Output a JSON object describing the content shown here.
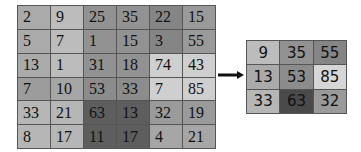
{
  "input_matrix": {
    "rows": [
      [
        "2",
        "9",
        "25",
        "35",
        "22",
        "15"
      ],
      [
        "5",
        "7",
        "1",
        "15",
        "3",
        "55"
      ],
      [
        "13",
        "1",
        "31",
        "18",
        "74",
        "43"
      ],
      [
        "7",
        "10",
        "53",
        "33",
        "7",
        "85"
      ],
      [
        "33",
        "21",
        "63",
        "13",
        "32",
        "19"
      ],
      [
        "8",
        "17",
        "11",
        "17",
        "4",
        "21"
      ]
    ],
    "colors": [
      [
        "#aaaaaa",
        "#bcbcbc",
        "#929292",
        "#929292",
        "#858585",
        "#9a9a9a"
      ],
      [
        "#aaaaaa",
        "#bcbcbc",
        "#929292",
        "#929292",
        "#858585",
        "#9a9a9a"
      ],
      [
        "#aaaaaa",
        "#bcbcbc",
        "#929292",
        "#929292",
        "#cfcfcf",
        "#cfcfcf"
      ],
      [
        "#9c9c9c",
        "#a6a6a6",
        "#8c8c8c",
        "#8c8c8c",
        "#cfcfcf",
        "#cfcfcf"
      ],
      [
        "#b6b6b6",
        "#b6b6b6",
        "#5e5e5e",
        "#5e5e5e",
        "#9a9a9a",
        "#9a9a9a"
      ],
      [
        "#b6b6b6",
        "#b6b6b6",
        "#5e5e5e",
        "#5e5e5e",
        "#a6a6a6",
        "#a6a6a6"
      ]
    ]
  },
  "output_matrix": {
    "rows": [
      [
        "9",
        "35",
        "55"
      ],
      [
        "13",
        "53",
        "85"
      ],
      [
        "33",
        "63",
        "32"
      ]
    ],
    "colors": [
      [
        "#bcbcbc",
        "#929292",
        "#858585"
      ],
      [
        "#aaaaaa",
        "#8c8c8c",
        "#d6d6d6"
      ],
      [
        "#b6b6b6",
        "#4a4a4a",
        "#9a9a9a"
      ]
    ]
  },
  "arrow": {
    "direction": "right",
    "color": "#111111"
  }
}
